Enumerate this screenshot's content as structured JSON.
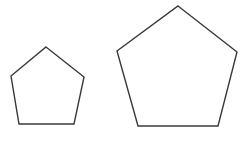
{
  "figure": {
    "background_color": "#ffffff",
    "stroke_color": "#3a3a3a",
    "fill_color": "#ffffff",
    "stroke_width": 1.4,
    "canvas": {
      "width": 243,
      "height": 142
    },
    "shapes": [
      {
        "name": "small-pentagon",
        "type": "pentagon",
        "sides": 5,
        "label": "Small pentagon",
        "center": {
          "x": 46.8,
          "y": 85.0
        },
        "circumradius": 38.5,
        "side_length": 45.2,
        "rotation_deg": 0,
        "points": "46,47 84,77 74,124 19,124 11,76",
        "vertices": [
          {
            "x": 46,
            "y": 47,
            "name": "apex"
          },
          {
            "x": 84,
            "y": 77,
            "name": "upper-right"
          },
          {
            "x": 74,
            "y": 124,
            "name": "lower-right"
          },
          {
            "x": 19,
            "y": 124,
            "name": "lower-left"
          },
          {
            "x": 11,
            "y": 76,
            "name": "upper-left"
          }
        ]
      },
      {
        "name": "large-pentagon",
        "type": "pentagon",
        "sides": 5,
        "label": "Large pentagon",
        "center": {
          "x": 177.5,
          "y": 77.5
        },
        "circumradius": 74.5,
        "side_length": 87.5,
        "rotation_deg": 0,
        "points": "178,6 237,52 218,126 138,126 117,51",
        "vertices": [
          {
            "x": 178,
            "y": 6,
            "name": "apex"
          },
          {
            "x": 237,
            "y": 52,
            "name": "upper-right"
          },
          {
            "x": 218,
            "y": 126,
            "name": "lower-right"
          },
          {
            "x": 138,
            "y": 126,
            "name": "lower-left"
          },
          {
            "x": 117,
            "y": 51,
            "name": "upper-left"
          }
        ]
      }
    ]
  }
}
